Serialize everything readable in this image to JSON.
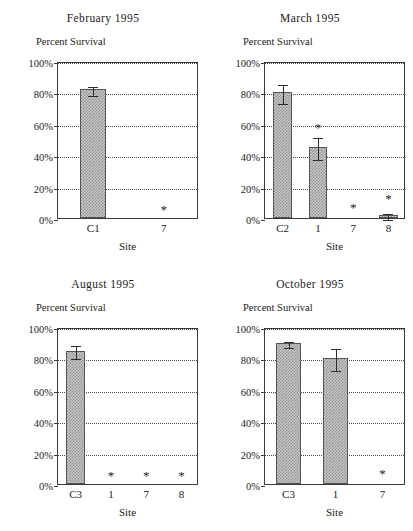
{
  "figure": {
    "yaxis_title": "Percent Survival",
    "xaxis_title": "Site",
    "ytick_labels": [
      "100%",
      "80%",
      "60%",
      "40%",
      "20%",
      "0%"
    ],
    "ytick_values": [
      100,
      80,
      60,
      40,
      20,
      0
    ],
    "significance_marker": "*"
  },
  "chart_data": [
    {
      "type": "bar",
      "title": "February 1995",
      "xlabel": "Site",
      "ylabel": "Percent Survival",
      "ylim": [
        0,
        100
      ],
      "yticks": [
        0,
        20,
        40,
        60,
        80,
        100
      ],
      "ytick_labels": [
        "0%",
        "20%",
        "40%",
        "60%",
        "80%",
        "100%"
      ],
      "grid": true,
      "categories": [
        "C1",
        "7"
      ],
      "values": [
        82,
        null
      ],
      "errors": [
        3,
        null
      ],
      "annotations": [
        {
          "category": "7",
          "text": "*",
          "y": 7
        }
      ]
    },
    {
      "type": "bar",
      "title": "March 1995",
      "xlabel": "Site",
      "ylabel": "Percent Survival",
      "ylim": [
        0,
        100
      ],
      "yticks": [
        0,
        20,
        40,
        60,
        80,
        100
      ],
      "ytick_labels": [
        "0%",
        "20%",
        "40%",
        "60%",
        "80%",
        "100%"
      ],
      "grid": true,
      "categories": [
        "C2",
        "1",
        "7",
        "8"
      ],
      "values": [
        80,
        45,
        null,
        2
      ],
      "errors": [
        6,
        7,
        null,
        2
      ],
      "annotations": [
        {
          "category": "1",
          "text": "*",
          "y": 59
        },
        {
          "category": "7",
          "text": "*",
          "y": 8
        },
        {
          "category": "8",
          "text": "*",
          "y": 14
        }
      ]
    },
    {
      "type": "bar",
      "title": "August 1995",
      "xlabel": "Site",
      "ylabel": "Percent Survival",
      "ylim": [
        0,
        100
      ],
      "yticks": [
        0,
        20,
        40,
        60,
        80,
        100
      ],
      "ytick_labels": [
        "0%",
        "20%",
        "40%",
        "60%",
        "80%",
        "100%"
      ],
      "grid": true,
      "categories": [
        "C3",
        "1",
        "7",
        "8"
      ],
      "values": [
        85,
        null,
        null,
        null
      ],
      "errors": [
        4,
        null,
        null,
        null
      ],
      "annotations": [
        {
          "category": "1",
          "text": "*",
          "y": 7
        },
        {
          "category": "7",
          "text": "*",
          "y": 7
        },
        {
          "category": "8",
          "text": "*",
          "y": 7
        }
      ]
    },
    {
      "type": "bar",
      "title": "October 1995",
      "xlabel": "Site",
      "ylabel": "Percent Survival",
      "ylim": [
        0,
        100
      ],
      "yticks": [
        0,
        20,
        40,
        60,
        80,
        100
      ],
      "ytick_labels": [
        "0%",
        "20%",
        "40%",
        "60%",
        "80%",
        "100%"
      ],
      "grid": true,
      "categories": [
        "C3",
        "1",
        "7"
      ],
      "values": [
        90,
        80,
        null
      ],
      "errors": [
        2,
        7,
        null
      ],
      "annotations": [
        {
          "category": "7",
          "text": "*",
          "y": 8
        }
      ]
    }
  ],
  "panels": [
    {
      "title": "February 1995",
      "position": "top-left"
    },
    {
      "title": "March 1995",
      "position": "top-right"
    },
    {
      "title": "August 1995",
      "position": "bottom-left"
    },
    {
      "title": "October 1995",
      "position": "bottom-right"
    }
  ]
}
